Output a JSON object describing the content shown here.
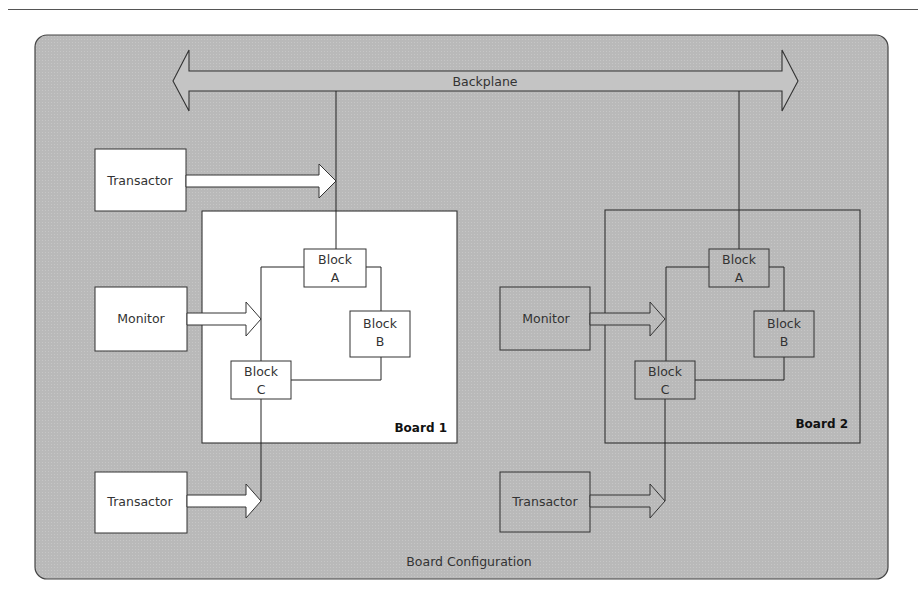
{
  "container": {
    "label": "Board Configuration",
    "fill": "#b8b8b8",
    "stroke": "#444444"
  },
  "backplane": {
    "label": "Backplane"
  },
  "boards": [
    {
      "label": "Board 1",
      "fill": "#ffffff",
      "blocks": [
        {
          "line1": "Block",
          "line2": "A"
        },
        {
          "line1": "Block",
          "line2": "B"
        },
        {
          "line1": "Block",
          "line2": "C"
        }
      ],
      "monitor": "Monitor",
      "transactor_top": "Transactor",
      "transactor_bottom": "Transactor"
    },
    {
      "label": "Board 2",
      "fill": "#b8b8b8",
      "blocks": [
        {
          "line1": "Block",
          "line2": "A"
        },
        {
          "line1": "Block",
          "line2": "B"
        },
        {
          "line1": "Block",
          "line2": "C"
        }
      ],
      "monitor": "Monitor",
      "transactor_bottom": "Transactor"
    }
  ]
}
